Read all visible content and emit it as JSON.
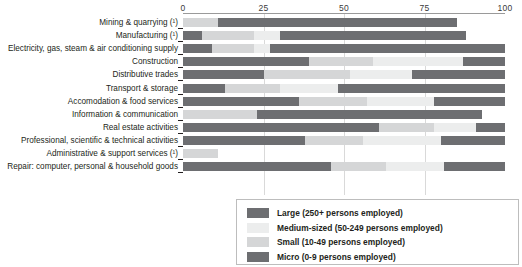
{
  "chart_data": {
    "type": "bar",
    "orientation": "horizontal",
    "stacked": true,
    "normalized": true,
    "title": "",
    "xlabel": "",
    "ylabel": "",
    "xlim": [
      0,
      100
    ],
    "grid": true,
    "legend_position": "bottom-right",
    "xticks": [
      "0",
      "25",
      "50",
      "75",
      "100"
    ],
    "xtick_values": [
      0,
      25,
      50,
      75,
      100
    ],
    "series": [
      {
        "name": "Micro (0-9 persons employed)",
        "color": "#6d6e71"
      },
      {
        "name": "Small (10-49 persons employed)",
        "color": "#d5d6d7"
      },
      {
        "name": "Medium-sized (50-249 persons employed)",
        "color": "#eceded"
      },
      {
        "name": "Large (250+ persons employed)",
        "color": "#6d6e71"
      }
    ],
    "categories": [
      "Mining & quarrying (¹)",
      "Manufacturing (¹)",
      "Electricity, gas, steam & air conditioning supply",
      "Construction",
      "Distributive trades",
      "Transport & storage",
      "Accomodation & food services",
      "Information & communication",
      "Real estate activities",
      "Professional, scientific & technical activities",
      "Administrative & support services (¹)",
      "Repair: computer, personal & household goods"
    ],
    "values": {
      "micro": [
        0,
        6,
        9,
        39,
        25,
        13,
        36,
        0,
        61,
        38,
        0,
        46
      ],
      "small": [
        11,
        16,
        13,
        20,
        27,
        17,
        21,
        23,
        17,
        18,
        11,
        17
      ],
      "medium": [
        0,
        8,
        5,
        28,
        19,
        18,
        21,
        0,
        13,
        24,
        0,
        18
      ],
      "large": [
        74,
        58,
        73,
        13,
        29,
        52,
        22,
        70,
        9,
        20,
        0,
        19
      ]
    },
    "value_note": "Each bar shows percentage share of employment by enterprise size class"
  },
  "axis": {
    "ticks": [
      {
        "label": "0",
        "value": 0
      },
      {
        "label": "25",
        "value": 25
      },
      {
        "label": "50",
        "value": 50
      },
      {
        "label": "75",
        "value": 75
      },
      {
        "label": "100",
        "value": 100
      }
    ]
  },
  "legend": {
    "items": [
      {
        "label": "Large (250+ persons employed)",
        "color": "#6d6e71"
      },
      {
        "label": "Medium-sized (50-249 persons employed)",
        "color": "#eceded"
      },
      {
        "label": "Small (10-49 persons employed)",
        "color": "#d5d6d7"
      },
      {
        "label": "Micro (0-9 persons employed)",
        "color": "#6d6e71"
      }
    ]
  },
  "colors": {
    "micro": "#6d6e71",
    "small": "#d5d6d7",
    "medium": "#eceded",
    "large": "#6d6e71",
    "axis": "#231f20",
    "grid": "#d9d9d9",
    "background": "#ffffff"
  }
}
